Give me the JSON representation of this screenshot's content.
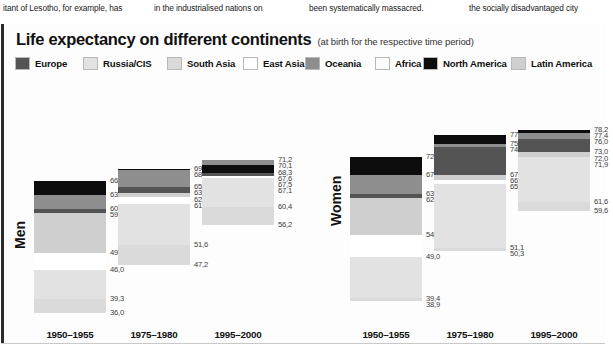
{
  "article_text": {
    "col1": "itant of Lesotho, for example, has",
    "col2": "in the industrialised nations on",
    "col3": "been systematically massacred.",
    "col4": "the socially  disadvantaged city"
  },
  "chart_data": {
    "type": "bar",
    "title": "Life expectancy on different continents",
    "subtitle": "(at birth for the respective time period)",
    "xlabel": "",
    "ylabel": "",
    "ylim": [
      30,
      80
    ],
    "grid": false,
    "legend_position": "top",
    "legend": [
      {
        "name": "Europe",
        "color": "#545454"
      },
      {
        "name": "Russia/CIS",
        "color": "#e2e2e2"
      },
      {
        "name": "South Asia",
        "color": "#dadada"
      },
      {
        "name": "East Asia",
        "color": "#ffffff"
      },
      {
        "name": "Oceania",
        "color": "#8e8e8e"
      },
      {
        "name": "Africa",
        "color": "#fbfbfb"
      },
      {
        "name": "North America",
        "color": "#0d0d0d"
      },
      {
        "name": "Latin America",
        "color": "#cfcfcf"
      }
    ],
    "groups": [
      {
        "name": "Men",
        "categories": [
          "1950–1955",
          "1975–1980",
          "1995–2000"
        ],
        "bars": [
          {
            "category": "1950–1955",
            "labels": [
              "66,3",
              "63,2",
              "60,0",
              "59,0",
              "49,9",
              "46,0",
              "39,3",
              "36,0"
            ],
            "values": [
              66.3,
              63.2,
              60.0,
              59.0,
              49.9,
              46.0,
              39.3,
              36.0
            ],
            "series": [
              "North America",
              "Oceania",
              "Europe",
              "Latin America",
              "East Asia",
              "Russia/CIS",
              "South Asia",
              "Africa"
            ]
          },
          {
            "category": "1975–1980",
            "labels": [
              "69,2",
              "68,9",
              "65,0",
              "63,7",
              "62,8",
              "61,1",
              "51,6",
              "47,2"
            ],
            "values": [
              69.2,
              68.9,
              65.0,
              63.7,
              62.8,
              61.1,
              51.6,
              47.2
            ],
            "series": [
              "North America",
              "Oceania",
              "Europe",
              "Latin America",
              "East Asia",
              "Russia/CIS",
              "South Asia",
              "Africa"
            ]
          },
          {
            "category": "1995–2000",
            "labels": [
              "71,2",
              "70,1",
              "68,3",
              "67,6",
              "67,5",
              "67,1",
              "60,4",
              "56,2"
            ],
            "values": [
              71.2,
              70.1,
              68.3,
              67.6,
              67.5,
              67.1,
              60.4,
              56.2
            ],
            "series": [
              "Oceania",
              "North America",
              "Europe",
              "Latin America",
              "East Asia",
              "Russia/CIS",
              "South Asia",
              "Africa"
            ]
          }
        ]
      },
      {
        "name": "Women",
        "categories": [
          "1950–1955",
          "1975–1980",
          "1995–2000"
        ],
        "bars": [
          {
            "category": "1950–1955",
            "labels": [
              "72,0",
              "67,7",
              "63,5",
              "62,6",
              "54,1",
              "49,0",
              "39,4",
              "38,9"
            ],
            "values": [
              72.0,
              67.7,
              63.5,
              62.6,
              54.1,
              49.0,
              39.4,
              38.9
            ],
            "series": [
              "North America",
              "Oceania",
              "Europe",
              "Latin America",
              "East Asia",
              "Russia/CIS",
              "South Asia",
              "Africa"
            ]
          },
          {
            "category": "1975–1980",
            "labels": [
              "77,0",
              "75,0",
              "74,3",
              "67,8",
              "66,7",
              "65,8",
              "51,1",
              "50,3"
            ],
            "values": [
              77.0,
              75.0,
              74.3,
              67.8,
              66.7,
              65.8,
              51.1,
              50.3
            ],
            "series": [
              "North America",
              "Oceania",
              "Europe",
              "Latin America",
              "East Asia",
              "Russia/CIS",
              "South Asia",
              "Africa"
            ]
          },
          {
            "category": "1995–2000",
            "labels": [
              "78,2",
              "77,4",
              "76,0",
              "73,0",
              "72,0",
              "71,9",
              "61,6",
              "59,6"
            ],
            "values": [
              78.2,
              77.4,
              76.0,
              73.0,
              72.0,
              71.9,
              61.6,
              59.6
            ],
            "series": [
              "North America",
              "Oceania",
              "Europe",
              "Latin America",
              "East Asia",
              "Russia/CIS",
              "South Asia",
              "Africa"
            ]
          }
        ]
      }
    ]
  }
}
